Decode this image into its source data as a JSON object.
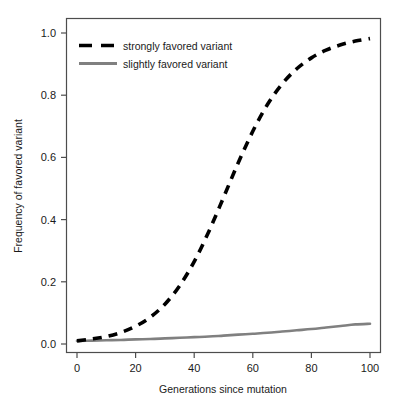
{
  "chart_data": {
    "type": "line",
    "title": "",
    "xlabel": "Generations since mutation",
    "ylabel": "Frequency of favored variant",
    "xlim": [
      0,
      100
    ],
    "ylim": [
      0.0,
      1.0
    ],
    "grid": false,
    "legend_position": "top-left",
    "xticks": [
      0,
      20,
      40,
      60,
      80,
      100
    ],
    "xtick_labels": [
      "0",
      "20",
      "40",
      "60",
      "80",
      "100"
    ],
    "yticks": [
      0.0,
      0.2,
      0.4,
      0.6,
      0.8,
      1.0
    ],
    "ytick_labels": [
      "0.0",
      "0.2",
      "0.4",
      "0.6",
      "0.8",
      "1.0"
    ],
    "x": [
      0,
      5,
      10,
      15,
      20,
      25,
      30,
      35,
      40,
      45,
      50,
      55,
      60,
      65,
      70,
      75,
      80,
      85,
      90,
      95,
      100
    ],
    "series": [
      {
        "name": "strongly favored variant",
        "style": "dashed",
        "color": "#000000",
        "width": 3.6,
        "values": [
          0.01,
          0.016,
          0.024,
          0.037,
          0.057,
          0.086,
          0.128,
          0.187,
          0.265,
          0.362,
          0.471,
          0.582,
          0.684,
          0.77,
          0.836,
          0.885,
          0.92,
          0.945,
          0.962,
          0.974,
          0.982
        ]
      },
      {
        "name": "slightly favored variant",
        "style": "solid",
        "color": "#808080",
        "width": 2.6,
        "values": [
          0.01,
          0.011,
          0.012,
          0.013,
          0.015,
          0.016,
          0.018,
          0.02,
          0.022,
          0.024,
          0.027,
          0.03,
          0.033,
          0.036,
          0.04,
          0.044,
          0.048,
          0.053,
          0.058,
          0.063,
          0.065
        ]
      }
    ]
  },
  "legend": {
    "entries": [
      {
        "label": "strongly favored variant",
        "style": "dashed",
        "color": "#000000"
      },
      {
        "label": "slightly favored variant",
        "style": "solid",
        "color": "#808080"
      }
    ]
  },
  "axes": {
    "x_title": "Generations since mutation",
    "y_title": "Frequency of favored variant",
    "x_tick_labels": [
      "0",
      "20",
      "40",
      "60",
      "80",
      "100"
    ],
    "y_tick_labels": [
      "0.0",
      "0.2",
      "0.4",
      "0.6",
      "0.8",
      "1.0"
    ]
  },
  "colors": {
    "frame": "#4d4d4d",
    "strong_series": "#000000",
    "slight_series": "#808080",
    "background": "#ffffff",
    "text": "#1a1a1a"
  }
}
